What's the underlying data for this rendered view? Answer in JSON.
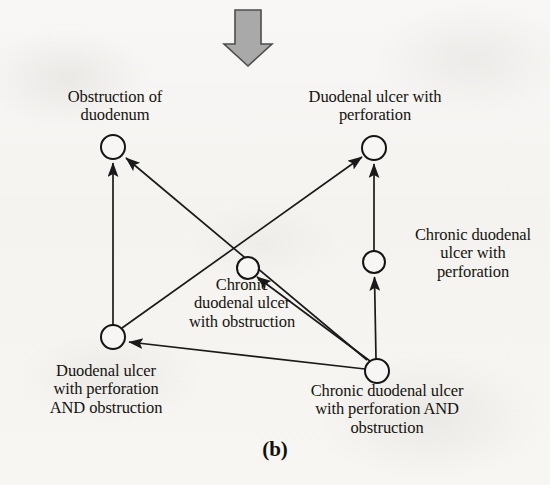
{
  "figure": {
    "caption": "(b)",
    "top_arrow": {
      "name": "down-arrow",
      "color": "#a8a8a8",
      "stroke": "#4a4a4a"
    },
    "background_color": "#f7f6f4",
    "ink_color": "#1a1a1a"
  },
  "nodes": [
    {
      "id": "obstruction-of-duodenum",
      "label": "Obstruction of\nduodenum",
      "cx": 113,
      "cy": 147,
      "r": 12
    },
    {
      "id": "duodenal-ulcer-with-perforation",
      "label": "Duodenal ulcer with\nperforation",
      "cx": 374,
      "cy": 148,
      "r": 12
    },
    {
      "id": "chronic-duodenal-ulcer-with-perforation",
      "label": "Chronic duodenal\nulcer with\nperforation",
      "cx": 374,
      "cy": 262,
      "r": 11
    },
    {
      "id": "chronic-duodenal-ulcer-with-obstruction",
      "label": "Chronic\nduodenal ulcer\nwith obstruction",
      "cx": 248,
      "cy": 268,
      "r": 11
    },
    {
      "id": "duodenal-ulcer-with-perforation-and-obstruction",
      "label": "Duodenal ulcer\nwith perforation\nAND obstruction",
      "cx": 113,
      "cy": 337,
      "r": 12
    },
    {
      "id": "chronic-duodenal-ulcer-with-perforation-and-obstruction",
      "label": "Chronic duodenal ulcer\nwith perforation AND\nobstruction",
      "cx": 377,
      "cy": 371,
      "r": 12
    }
  ],
  "edges": [
    {
      "id": "e1",
      "from": "duodenal-ulcer-with-perforation-and-obstruction",
      "to": "obstruction-of-duodenum"
    },
    {
      "id": "e2",
      "from": "chronic-duodenal-ulcer-with-perforation-and-obstruction",
      "to": "obstruction-of-duodenum"
    },
    {
      "id": "e3",
      "from": "duodenal-ulcer-with-perforation-and-obstruction",
      "to": "duodenal-ulcer-with-perforation"
    },
    {
      "id": "e4",
      "from": "chronic-duodenal-ulcer-with-perforation",
      "to": "duodenal-ulcer-with-perforation"
    },
    {
      "id": "e5",
      "from": "chronic-duodenal-ulcer-with-perforation-and-obstruction",
      "to": "chronic-duodenal-ulcer-with-perforation"
    },
    {
      "id": "e6",
      "from": "chronic-duodenal-ulcer-with-perforation-and-obstruction",
      "to": "duodenal-ulcer-with-perforation-and-obstruction"
    },
    {
      "id": "e7",
      "from": "chronic-duodenal-ulcer-with-perforation-and-obstruction",
      "to": "chronic-duodenal-ulcer-with-obstruction"
    }
  ]
}
